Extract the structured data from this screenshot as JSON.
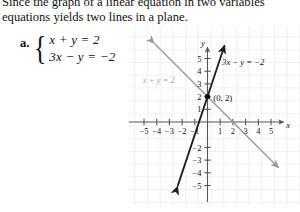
{
  "intro": {
    "line1": "Since the graph of a linear equation in two variables",
    "line2": "equations yields two lines in a plane."
  },
  "problem": {
    "part_label": "a.",
    "equation1": "x + y = 2",
    "equation2": "3x − y = −2",
    "brace": "{"
  },
  "chart_data": {
    "type": "line",
    "title": "",
    "xlabel": "x",
    "ylabel": "y",
    "xlim": [
      -6,
      6
    ],
    "ylim": [
      -6,
      6
    ],
    "grid": true,
    "x_ticks": [
      -5,
      -4,
      -3,
      -2,
      -1,
      1,
      2,
      3,
      4,
      5
    ],
    "x_tick_labels": [
      "−5",
      "−4",
      "−3",
      "−2",
      "−1",
      "1",
      "2",
      "3",
      "4",
      "5"
    ],
    "y_ticks": [
      5,
      4,
      3,
      2,
      1,
      -2,
      -3,
      -4,
      -5
    ],
    "y_tick_labels": [
      "5",
      "4",
      "3",
      "2",
      "1",
      "−2",
      "−3",
      "−4",
      "−5"
    ],
    "series": [
      {
        "name": "x + y = 2",
        "label": "x + y = 2",
        "color": "#9b9b9b",
        "slope": -1,
        "intercept": 2,
        "x_from": -4.2,
        "x_to": 5.6,
        "label_x": -5.1,
        "label_y": 3.1,
        "arrows": "both"
      },
      {
        "name": "3x − y = −2",
        "label": "3x − y = −2",
        "color": "#1c1c1c",
        "slope": 3,
        "intercept": 2,
        "x_from": -2.35,
        "x_to": 1.35,
        "label_x": 1.15,
        "label_y": 4.45,
        "arrows": "both"
      }
    ],
    "annotations": [
      {
        "name": "intersection-point",
        "label": "(0, 2)",
        "x": 0,
        "y": 2,
        "label_dx": 0.45,
        "label_dy": 0.35
      }
    ]
  }
}
